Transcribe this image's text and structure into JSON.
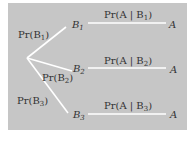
{
  "diagram": {
    "type": "probability-tree",
    "root": {
      "branches": [
        {
          "edge_label": "Pr(B",
          "edge_sub": "1",
          "node": "B",
          "node_sub": "1",
          "cond_label": "Pr(A | B",
          "cond_sub": "1",
          "leaf": "A"
        },
        {
          "edge_label": "Pr(B",
          "edge_sub": "2",
          "node": "B",
          "node_sub": "2",
          "cond_label": "Pr(A | B",
          "cond_sub": "2",
          "leaf": "A"
        },
        {
          "edge_label": "Pr(B",
          "edge_sub": "3",
          "node": "B",
          "node_sub": "3",
          "cond_label": "Pr(A | B",
          "cond_sub": "3",
          "leaf": "A"
        }
      ]
    },
    "colors": {
      "background": "#c6c6c6",
      "lines": "#ffffff",
      "text": "#333333"
    }
  }
}
